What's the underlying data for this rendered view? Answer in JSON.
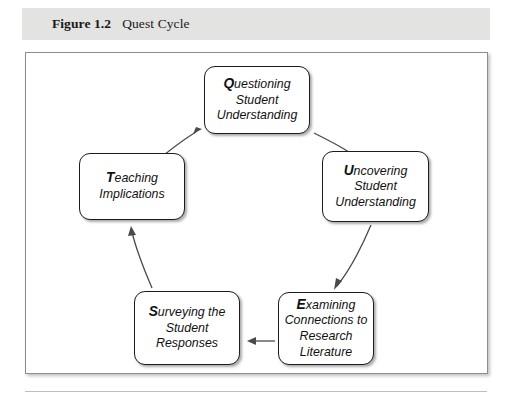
{
  "caption": {
    "label": "Figure 1.2",
    "title": "Quest Cycle"
  },
  "diagram": {
    "name": "quest-cycle",
    "nodes": [
      {
        "id": "questioning",
        "initial": "Q",
        "rest": "uestioning",
        "lines": [
          "Questioning",
          "Student",
          "Understanding"
        ],
        "line2": "Student",
        "line3": "Understanding"
      },
      {
        "id": "uncovering",
        "initial": "U",
        "rest": "ncovering",
        "lines": [
          "Uncovering",
          "Student",
          "Understanding"
        ],
        "line2": "Student",
        "line3": "Understanding"
      },
      {
        "id": "examining",
        "initial": "E",
        "rest": "xamining",
        "lines": [
          "Examining",
          "Connections to",
          "Research",
          "Literature"
        ],
        "line2": "Connections to",
        "line3": "Research",
        "line4": "Literature"
      },
      {
        "id": "surveying",
        "initial": "S",
        "rest": "urveying the",
        "lines": [
          "Surveying the",
          "Student",
          "Responses"
        ],
        "line2": "Student",
        "line3": "Responses"
      },
      {
        "id": "teaching",
        "initial": "T",
        "rest": "eaching",
        "lines": [
          "Teaching",
          "Implications"
        ],
        "line2": "Implications"
      }
    ],
    "edges": [
      {
        "from": "questioning",
        "to": "uncovering"
      },
      {
        "from": "uncovering",
        "to": "examining"
      },
      {
        "from": "examining",
        "to": "surveying"
      },
      {
        "from": "surveying",
        "to": "teaching"
      },
      {
        "from": "teaching",
        "to": "questioning"
      }
    ]
  },
  "colors": {
    "caption_band": "#e3e3e1",
    "node_border": "#1c1c1c",
    "arrow": "#4a4a4a",
    "frame_border": "#8d8d8d"
  }
}
